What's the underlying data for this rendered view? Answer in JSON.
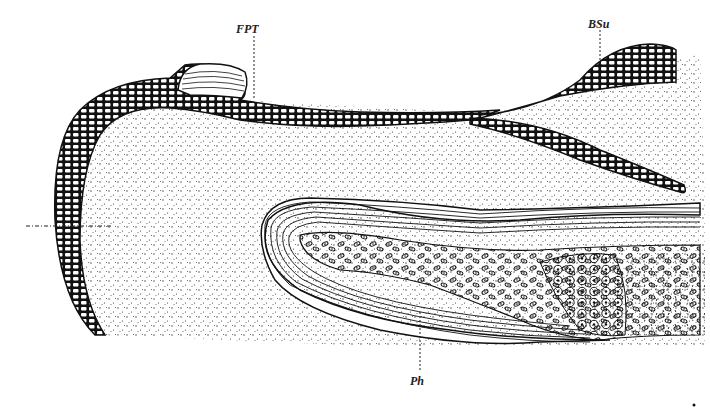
{
  "figure": {
    "type": "histological section drawing",
    "labels": [
      {
        "id": "fpt",
        "text": "FPT",
        "x": 236,
        "y": 22
      },
      {
        "id": "bsu",
        "text": "BSu",
        "x": 588,
        "y": 17
      },
      {
        "id": "ph",
        "text": "Ph",
        "x": 410,
        "y": 372
      }
    ],
    "colors": {
      "ink": "#1a1a1a",
      "paper": "#ffffff",
      "stipple": "#3a3a3a"
    }
  }
}
